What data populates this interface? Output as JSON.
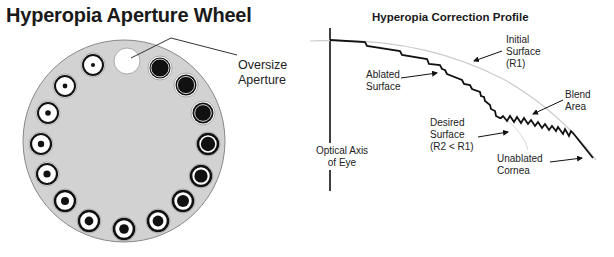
{
  "left_panel": {
    "title": "Hyperopia Aperture Wheel",
    "oversize_label_line1": "Oversize",
    "oversize_label_line2": "Aperture",
    "wheel": {
      "center": [
        124,
        141
      ],
      "radius": 101,
      "fill": "#d4d4d4",
      "aperture_count": 16,
      "oversize_aperture_position": "top"
    }
  },
  "right_panel": {
    "title": "Hyperopia Correction Profile",
    "labels": {
      "initial_surface": [
        "Initial",
        "Surface",
        "(R1)"
      ],
      "ablated_surface": [
        "Ablated",
        "Surface"
      ],
      "blend_area": [
        "Blend",
        "Area"
      ],
      "desired_surface": [
        "Desired",
        "Surface",
        "(R2 < R1)"
      ],
      "optical_axis": [
        "Optical Axis",
        "of Eye"
      ],
      "unablated_cornea": [
        "Unablated",
        "Cornea"
      ]
    }
  }
}
